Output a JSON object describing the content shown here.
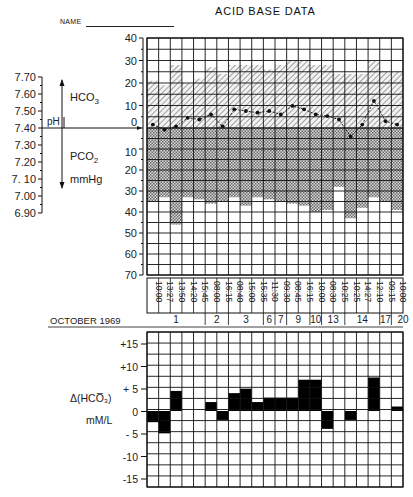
{
  "header": {
    "title": "ACID BASE DATA",
    "name_label": "NAME"
  },
  "upper_chart": {
    "ph_axis_label": "pH",
    "hco3_label": "HCO",
    "hco3_sub": "3",
    "pco2_label": "PCO",
    "pco2_sub": "2",
    "pco2_unit": "mmHg",
    "month_label": "OCTOBER 1969"
  },
  "lower_chart": {
    "label_line1": "Δ(HCO̅₃)",
    "label_line2": "mM/L"
  },
  "chart_data": [
    {
      "type": "bar",
      "title": "ACID BASE DATA",
      "xlabel": "OCTOBER 1969",
      "ylabel_left": "pH",
      "ylabel_upper": "HCO3",
      "ylabel_lower": "PCO2 mmHg",
      "ph_ticks": [
        "7.70",
        "7.60",
        "7.50",
        "7.40",
        "7.30",
        "7.20",
        "7. 10",
        "7.00",
        "6.90"
      ],
      "hco3_ticks": [
        "40",
        "30",
        "20",
        "10",
        "0"
      ],
      "pco2_ticks": [
        "10",
        "20",
        "30",
        "40",
        "50",
        "60",
        "70"
      ],
      "times": [
        "10:00",
        "13:27",
        "13:50",
        "14:20",
        "15:45",
        "08:00",
        "16:15",
        "08:40",
        "15:00",
        "15:35",
        "11:30",
        "09:30",
        "08:45",
        "16:15",
        "10:00",
        "08:30",
        "10:25",
        "10:25",
        "14:27",
        "12:10",
        "09:15",
        "10:00"
      ],
      "days": [
        {
          "label": "1",
          "span": 5
        },
        {
          "label": "2",
          "span": 2
        },
        {
          "label": "3",
          "span": 3
        },
        {
          "label": "6",
          "span": 1
        },
        {
          "label": "7",
          "span": 1
        },
        {
          "label": "9",
          "span": 2
        },
        {
          "label": "10",
          "span": 1
        },
        {
          "label": "13",
          "span": 2
        },
        {
          "label": "14",
          "span": 3
        },
        {
          "label": "17",
          "span": 1
        },
        {
          "label": "20",
          "span": 2
        }
      ],
      "series": [
        {
          "name": "HCO3 (mM/L)",
          "values": [
            21,
            19,
            28,
            20,
            22,
            27,
            24,
            28,
            28,
            28,
            26,
            28,
            30,
            30,
            28,
            28,
            24,
            24,
            24,
            30,
            25,
            25
          ]
        },
        {
          "name": "PCO2 (mmHg)",
          "values": [
            35,
            33,
            46,
            33,
            34,
            36,
            35,
            33,
            37,
            33,
            34,
            35,
            36,
            37,
            40,
            39,
            28,
            43,
            38,
            33,
            35,
            39
          ]
        },
        {
          "name": "pH",
          "values": [
            7.42,
            7.39,
            7.41,
            7.46,
            7.45,
            7.48,
            7.41,
            7.51,
            7.5,
            7.49,
            7.5,
            7.48,
            7.53,
            7.51,
            7.48,
            7.47,
            7.45,
            7.35,
            7.42,
            7.56,
            7.44,
            7.42
          ]
        }
      ],
      "ylim_hco3": [
        0,
        40
      ],
      "ylim_pco2": [
        0,
        70
      ],
      "ylim_ph": [
        6.9,
        7.7
      ],
      "grid": true
    },
    {
      "type": "bar",
      "ylabel": "Δ(HCO3-) mM/L",
      "yticks": [
        "+15",
        "+10",
        "+ 5",
        "0",
        "- 5",
        "-10",
        "-15"
      ],
      "ylim": [
        -17.5,
        17.5
      ],
      "values": [
        -2.5,
        -5,
        4.5,
        0,
        0,
        2,
        -2,
        4,
        5,
        2,
        3,
        3,
        3,
        7,
        7,
        -4,
        0,
        -2,
        0,
        7.5,
        0,
        1
      ],
      "grid": true
    }
  ]
}
